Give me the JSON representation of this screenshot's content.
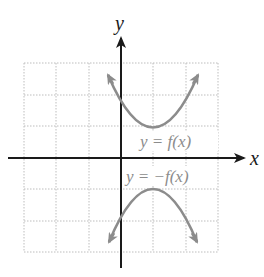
{
  "figure": {
    "x_axis_label": "x",
    "y_axis_label": "y",
    "curves": [
      {
        "label": "y = f(x)",
        "color": "#8c8c8c",
        "vertex": [
          1,
          1
        ],
        "opens": "up"
      },
      {
        "label": "y = −f(x)",
        "color": "#8c8c8c",
        "vertex": [
          1,
          -1
        ],
        "opens": "down"
      }
    ],
    "grid": {
      "x_range": [
        -3,
        3
      ],
      "y_range": [
        -3,
        3
      ],
      "style": "dotted",
      "color": "#bdbdbd"
    },
    "axis_color": "#1a1a1a"
  }
}
